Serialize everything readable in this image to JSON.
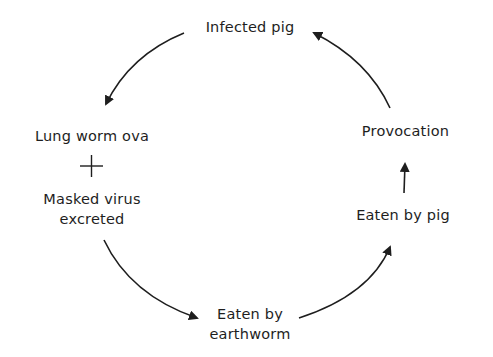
{
  "diagram": {
    "type": "cycle",
    "nodes": [
      {
        "id": "infected_pig",
        "label": "Infected pig"
      },
      {
        "id": "ova_virus",
        "label_line1": "Lung worm ova",
        "connector": "+",
        "label_line2": "Masked virus",
        "label_line3": "excreted"
      },
      {
        "id": "earthworm",
        "label_line1": "Eaten by",
        "label_line2": "earthworm"
      },
      {
        "id": "eaten_by_pig",
        "label": "Eaten by pig"
      },
      {
        "id": "provocation",
        "label": "Provocation"
      }
    ],
    "edges": [
      {
        "from": "infected_pig",
        "to": "ova_virus"
      },
      {
        "from": "ova_virus",
        "to": "earthworm"
      },
      {
        "from": "earthworm",
        "to": "eaten_by_pig"
      },
      {
        "from": "eaten_by_pig",
        "to": "provocation"
      },
      {
        "from": "provocation",
        "to": "infected_pig"
      }
    ],
    "colors": {
      "stroke": "#1e1e1e",
      "background": "#ffffff"
    }
  }
}
